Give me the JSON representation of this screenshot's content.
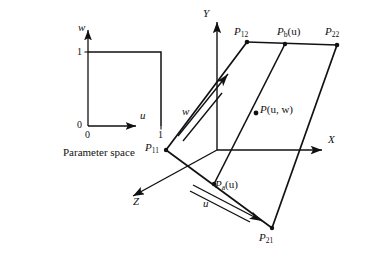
{
  "figure": {
    "parameter_space": {
      "caption": "Parameter space",
      "axis_w_label": "w",
      "axis_u_label": "u",
      "tick_w_one": "1",
      "tick_origin_w": "0",
      "tick_origin_u": "0",
      "tick_u_one": "1"
    },
    "patch": {
      "axis_x_label": "X",
      "axis_y_label": "Y",
      "axis_z_label": "Z",
      "param_w_label": "w",
      "param_u_label": "u",
      "corner_p11": "P",
      "corner_p11_sub": "11",
      "corner_p12": "P",
      "corner_p12_sub": "12",
      "corner_p21": "P",
      "corner_p21_sub": "21",
      "corner_p22": "P",
      "corner_p22_sub": "22",
      "curve_pb": "P",
      "curve_pb_sub": "b",
      "curve_pb_arg": "(u)",
      "curve_pa": "P",
      "curve_pa_sub": "a",
      "curve_pa_arg": "(u)",
      "point_p": "P",
      "point_p_arg": "(u, w)"
    }
  },
  "colors": {
    "ink": "#111111",
    "background": "#ffffff"
  }
}
